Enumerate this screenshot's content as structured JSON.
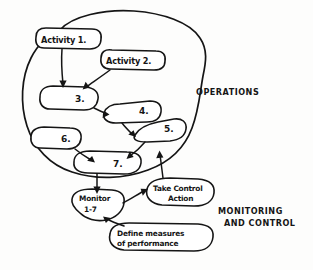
{
  "diagram": {
    "ink_color": "#151515",
    "paper_color": "#fdfdfc",
    "regions": [
      {
        "id": "operations",
        "label": "OPERATIONS",
        "kind": "boundary-blob"
      },
      {
        "id": "monitoring-and-control",
        "label_line1": "MONITORING",
        "label_line2": "AND CONTROL",
        "kind": "annotation"
      }
    ],
    "nodes": [
      {
        "id": "activity-1",
        "label": "Activity 1.",
        "shape": "rounded-rect",
        "region": "operations"
      },
      {
        "id": "activity-2",
        "label": "Activity 2.",
        "shape": "rounded-rect",
        "region": "operations"
      },
      {
        "id": "node-3",
        "label": "3.",
        "shape": "lozenge",
        "region": "operations"
      },
      {
        "id": "node-4",
        "label": "4.",
        "shape": "lozenge",
        "region": "operations"
      },
      {
        "id": "node-5",
        "label": "5.",
        "shape": "lozenge",
        "region": "operations"
      },
      {
        "id": "node-6",
        "label": "6.",
        "shape": "lozenge",
        "region": "operations"
      },
      {
        "id": "node-7",
        "label": "7.",
        "shape": "lozenge",
        "region": "operations"
      },
      {
        "id": "monitor",
        "label_line1": "Monitor",
        "label_line2": "1-7",
        "shape": "blob",
        "region": "monitoring-and-control"
      },
      {
        "id": "take-control-action",
        "label_line1": "Take Control",
        "label_line2": "Action",
        "shape": "blob",
        "region": "monitoring-and-control"
      },
      {
        "id": "define-measures",
        "label_line1": "Define measures",
        "label_line2": "of performance",
        "shape": "rounded-rect",
        "region": "monitoring-and-control"
      }
    ],
    "edges": [
      {
        "from": "activity-1",
        "to": "node-3"
      },
      {
        "from": "activity-2",
        "to": "node-3"
      },
      {
        "from": "node-3",
        "to": "node-4"
      },
      {
        "from": "node-4",
        "to": "node-5"
      },
      {
        "from": "node-5",
        "to": "node-7"
      },
      {
        "from": "node-6",
        "to": "node-7"
      },
      {
        "from": "node-7",
        "to": "monitor"
      },
      {
        "from": "monitor",
        "to": "take-control-action"
      },
      {
        "from": "take-control-action",
        "to": "operations"
      },
      {
        "from": "define-measures",
        "to": "monitor"
      }
    ]
  }
}
